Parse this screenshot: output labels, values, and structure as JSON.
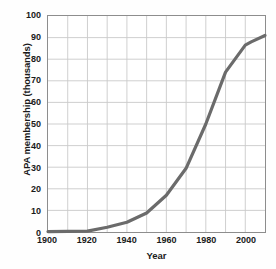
{
  "chart_data": {
    "type": "line",
    "title": "",
    "xlabel": "Year",
    "ylabel": "APA membership (thousands)",
    "xlim": [
      1900,
      2010
    ],
    "ylim": [
      0,
      100
    ],
    "xticks": [
      1900,
      1920,
      1940,
      1960,
      1980,
      2000
    ],
    "xtick_labels": [
      "1900",
      "1920",
      "1940",
      "1960",
      "1980",
      "2000"
    ],
    "yticks": [
      0,
      10,
      20,
      30,
      40,
      50,
      60,
      70,
      80,
      90,
      100
    ],
    "ytick_labels": [
      "0",
      "10",
      "20",
      "30",
      "40",
      "50",
      "60",
      "70",
      "80",
      "90",
      "100"
    ],
    "x_minor_step": 10,
    "y_minor_step": 10,
    "grid": true,
    "legend": "none",
    "series": [
      {
        "name": "APA membership",
        "color": "#6b6b6b",
        "line_width": 3.2,
        "x": [
          1900,
          1910,
          1920,
          1930,
          1940,
          1950,
          1960,
          1970,
          1980,
          1990,
          2000,
          2003,
          2010
        ],
        "values": [
          0.2,
          0.3,
          0.4,
          2.2,
          4.5,
          8.8,
          17.0,
          29.5,
          50.0,
          74.0,
          86.5,
          88.0,
          91.0
        ]
      }
    ],
    "axis_color": "#8d8d8d",
    "grid_color": "#c9c9c9",
    "background": "#ffffff"
  }
}
